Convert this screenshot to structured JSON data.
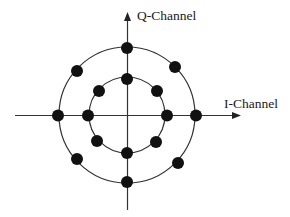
{
  "diagram": {
    "type": "constellation-diagram",
    "scheme": "16-APSK (two concentric rings, 8 points each)",
    "axes": {
      "horizontal_label": "I-Channel",
      "vertical_label": "Q-Channel"
    },
    "colors": {
      "line": "#333333",
      "point": "#111111",
      "background": "#ffffff"
    },
    "rings": [
      {
        "name": "inner-ring",
        "points": 8,
        "angles_deg": [
          0,
          45,
          90,
          135,
          180,
          225,
          270,
          315
        ]
      },
      {
        "name": "outer-ring",
        "points": 8,
        "angles_deg": [
          0,
          45,
          90,
          135,
          180,
          225,
          270,
          315
        ]
      }
    ]
  }
}
